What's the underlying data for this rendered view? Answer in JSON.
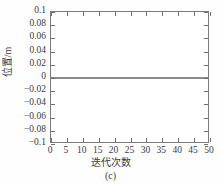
{
  "figure": {
    "caption": "(c)",
    "background_color": "#fefefe",
    "frame_color": "#7b7b7b"
  },
  "chart_data": {
    "type": "line",
    "title": "",
    "subtitle": "",
    "caption": "(c)",
    "xlabel": "迭代次数",
    "ylabel": "位置/m",
    "xlim": [
      0,
      50
    ],
    "ylim": [
      -0.1,
      0.1
    ],
    "xticks": [
      0,
      5,
      10,
      15,
      20,
      25,
      30,
      35,
      40,
      45,
      50
    ],
    "xtick_labels": [
      "0",
      "5",
      "10",
      "15",
      "20",
      "25",
      "30",
      "35",
      "40",
      "45",
      "50"
    ],
    "yticks": [
      -0.1,
      -0.08,
      -0.06,
      -0.04,
      -0.02,
      0,
      0.02,
      0.04,
      0.06,
      0.08,
      0.1
    ],
    "ytick_labels": [
      "-0.1",
      "-0.08",
      "-0.06",
      "-0.04",
      "-0.02",
      "0",
      "0.02",
      "0.04",
      "0.06",
      "0.08",
      "0.1"
    ],
    "grid": false,
    "legend": null,
    "legend_position": "none",
    "tick_direction": "in",
    "box": true,
    "series": [
      {
        "name": "位置",
        "color": "#8a8a8a",
        "linewidth": 1.6,
        "x": [
          0,
          5,
          10,
          15,
          20,
          25,
          30,
          35,
          40,
          45,
          50
        ],
        "values": [
          0,
          0,
          0,
          0,
          0,
          0,
          0,
          0,
          0,
          0,
          0
        ]
      }
    ]
  }
}
